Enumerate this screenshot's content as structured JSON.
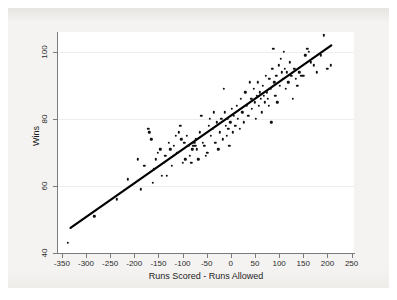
{
  "figure": {
    "background_color": "#f4f3f1",
    "plot_background_color": "#ffffff",
    "axis_color": "#7b7b7b",
    "gridline_color": "#ededf2",
    "marker_color": "#111111",
    "fit_line_color": "#000000"
  },
  "chart_data": {
    "type": "scatter",
    "title": "",
    "xlabel": "Runs Scored - Runs Allowed",
    "ylabel": "Wins",
    "xlim": [
      -360,
      255
    ],
    "ylim": [
      40,
      106
    ],
    "xticks": [
      -350,
      -300,
      -250,
      -200,
      -150,
      -100,
      -50,
      0,
      50,
      100,
      150,
      200,
      250
    ],
    "xticklabels": [
      "-350",
      "-300",
      "-250",
      "-200",
      "-150",
      "-100",
      "-50",
      "0",
      "50",
      "100",
      "150",
      "200",
      "250"
    ],
    "yticks": [
      40,
      60,
      80,
      100
    ],
    "yticklabels": [
      "40",
      "60",
      "80",
      "100"
    ],
    "grid": "horizontal-faint",
    "legend": null,
    "series": [
      {
        "name": "Teams",
        "marker": "filled-circle",
        "points": [
          [
            -337,
            43
          ],
          [
            -283,
            51
          ],
          [
            -236,
            56
          ],
          [
            -213,
            62
          ],
          [
            -193,
            68
          ],
          [
            -186,
            59
          ],
          [
            -179,
            66
          ],
          [
            -171,
            77
          ],
          [
            -169,
            76
          ],
          [
            -165,
            74
          ],
          [
            -162,
            61
          ],
          [
            -159,
            65
          ],
          [
            -155,
            68
          ],
          [
            -151,
            70
          ],
          [
            -146,
            71
          ],
          [
            -143,
            63
          ],
          [
            -139,
            67
          ],
          [
            -136,
            69
          ],
          [
            -132,
            63
          ],
          [
            -129,
            73
          ],
          [
            -125,
            71
          ],
          [
            -122,
            66
          ],
          [
            -118,
            72
          ],
          [
            -114,
            75
          ],
          [
            -111,
            70
          ],
          [
            -108,
            76
          ],
          [
            -105,
            78
          ],
          [
            -103,
            74
          ],
          [
            -99,
            67
          ],
          [
            -96,
            73
          ],
          [
            -94,
            68
          ],
          [
            -91,
            75
          ],
          [
            -88,
            72
          ],
          [
            -85,
            69
          ],
          [
            -82,
            67
          ],
          [
            -80,
            71
          ],
          [
            -78,
            72
          ],
          [
            -76,
            73
          ],
          [
            -74,
            72
          ],
          [
            -72,
            74
          ],
          [
            -70,
            71
          ],
          [
            -67,
            68
          ],
          [
            -64,
            76
          ],
          [
            -61,
            81
          ],
          [
            -58,
            73
          ],
          [
            -55,
            72
          ],
          [
            -52,
            69
          ],
          [
            -49,
            70
          ],
          [
            -46,
            78
          ],
          [
            -44,
            80
          ],
          [
            -41,
            75
          ],
          [
            -38,
            77
          ],
          [
            -35,
            82
          ],
          [
            -32,
            73
          ],
          [
            -29,
            79
          ],
          [
            -26,
            71
          ],
          [
            -23,
            76
          ],
          [
            -20,
            80
          ],
          [
            -17,
            74
          ],
          [
            -15,
            89
          ],
          [
            -13,
            82
          ],
          [
            -11,
            78
          ],
          [
            -9,
            75
          ],
          [
            -7,
            80
          ],
          [
            -5,
            77
          ],
          [
            -3,
            72
          ],
          [
            -1,
            79
          ],
          [
            2,
            83
          ],
          [
            4,
            76
          ],
          [
            6,
            81
          ],
          [
            9,
            78
          ],
          [
            12,
            84
          ],
          [
            15,
            80
          ],
          [
            18,
            77
          ],
          [
            21,
            86
          ],
          [
            24,
            82
          ],
          [
            27,
            79
          ],
          [
            30,
            88
          ],
          [
            33,
            84
          ],
          [
            36,
            81
          ],
          [
            39,
            91
          ],
          [
            42,
            86
          ],
          [
            44,
            83
          ],
          [
            47,
            89
          ],
          [
            49,
            85
          ],
          [
            52,
            80
          ],
          [
            54,
            87
          ],
          [
            56,
            91
          ],
          [
            58,
            84
          ],
          [
            60,
            88
          ],
          [
            62,
            86
          ],
          [
            64,
            82
          ],
          [
            66,
            90
          ],
          [
            68,
            87
          ],
          [
            70,
            85
          ],
          [
            72,
            93
          ],
          [
            74,
            88
          ],
          [
            76,
            86
          ],
          [
            78,
            84
          ],
          [
            80,
            92
          ],
          [
            82,
            89
          ],
          [
            84,
            79
          ],
          [
            86,
            95
          ],
          [
            88,
            101
          ],
          [
            90,
            91
          ],
          [
            92,
            87
          ],
          [
            94,
            93
          ],
          [
            96,
            85
          ],
          [
            99,
            96
          ],
          [
            101,
            90
          ],
          [
            103,
            98
          ],
          [
            105,
            94
          ],
          [
            107,
            92
          ],
          [
            110,
            100
          ],
          [
            112,
            95
          ],
          [
            114,
            89
          ],
          [
            116,
            94
          ],
          [
            119,
            91
          ],
          [
            122,
            97
          ],
          [
            125,
            93
          ],
          [
            128,
            86
          ],
          [
            131,
            95
          ],
          [
            134,
            92
          ],
          [
            138,
            90
          ],
          [
            142,
            94
          ],
          [
            146,
            93
          ],
          [
            150,
            93
          ],
          [
            154,
            99
          ],
          [
            158,
            101
          ],
          [
            162,
            100
          ],
          [
            166,
            97
          ],
          [
            172,
            96
          ],
          [
            178,
            94
          ],
          [
            186,
            99
          ],
          [
            193,
            105
          ],
          [
            200,
            95
          ],
          [
            207,
            96
          ]
        ]
      }
    ],
    "fit_line": {
      "name": "Linear fit",
      "x_start": -332,
      "y_start": 47.5,
      "x_end": 208,
      "y_end": 102.0,
      "width_px": 2.2
    }
  }
}
